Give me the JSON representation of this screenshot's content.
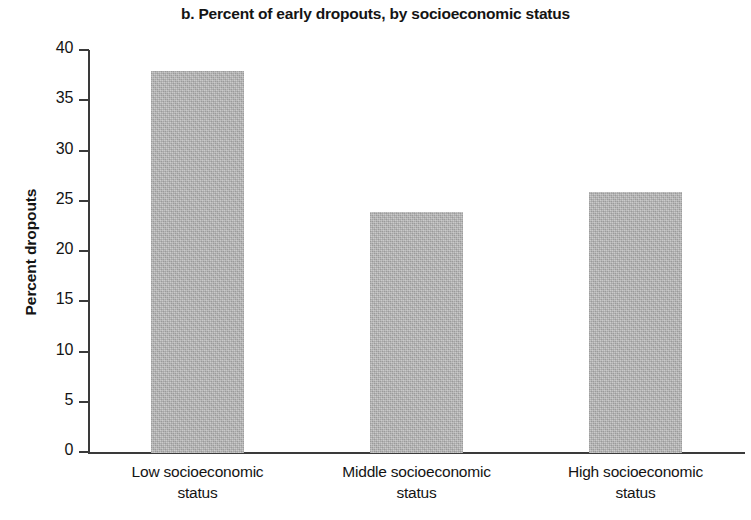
{
  "chart_data": {
    "type": "bar",
    "title": "b. Percent of early dropouts, by socioeconomic status",
    "xlabel": "",
    "ylabel": "Percent dropouts",
    "categories": [
      "Low socioeconomic status",
      "Middle socioeconomic status",
      "High socioeconomic status"
    ],
    "values": [
      38,
      24,
      26
    ],
    "ylim": [
      0,
      40
    ],
    "ytick_labels": [
      "0",
      "5",
      "10",
      "15",
      "20",
      "25",
      "30",
      "35",
      "40"
    ],
    "ytick_values": [
      0,
      5,
      10,
      15,
      20,
      25,
      30,
      35,
      40
    ],
    "grid": false,
    "legend": null,
    "bar_color": "#b2b2b2",
    "axis_color": "#3a3a3a",
    "text_color": "#141414"
  },
  "axis": {
    "y_title": "Percent dropouts"
  },
  "category_labels": [
    {
      "line1": "Low socioeconomic",
      "line2": "status"
    },
    {
      "line1": "Middle socioeconomic",
      "line2": "status"
    },
    {
      "line1": "High socioeconomic",
      "line2": "status"
    }
  ]
}
